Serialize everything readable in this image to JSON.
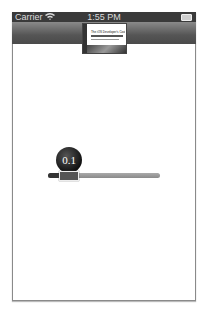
{
  "status_bar": {
    "carrier": "Carrier",
    "time": "1:55 PM",
    "wifi_icon": "wifi-icon",
    "battery_icon": "battery-icon"
  },
  "nav_bar": {
    "title_image": "book-cover",
    "cover_text": "The iOS Developer's Cookbook"
  },
  "slider": {
    "value": "0.1",
    "min": 0,
    "max": 1
  },
  "colors": {
    "status_bar_bg": "#3a3a3a",
    "nav_bar_bg": "#555555",
    "slider_fill": "#333333",
    "slider_track": "#9a9a9a",
    "bubble_bg": "#1a1a1a"
  }
}
